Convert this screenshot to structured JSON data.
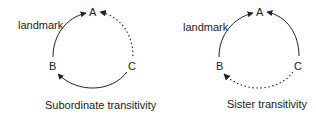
{
  "diagrams": [
    {
      "title": "Subordinate transitivity",
      "nodes": {
        "A": "A",
        "B": "B",
        "C": "C"
      },
      "landmark_label": "landmark",
      "edges": [
        {
          "from": "B",
          "to": "A",
          "style": "solid"
        },
        {
          "from": "C",
          "to": "B",
          "style": "solid"
        },
        {
          "from": "C",
          "to": "A",
          "style": "dotted"
        }
      ]
    },
    {
      "title": "Sister transitivity",
      "nodes": {
        "A": "A",
        "B": "B",
        "C": "C"
      },
      "landmark_label": "landmark",
      "edges": [
        {
          "from": "B",
          "to": "A",
          "style": "solid"
        },
        {
          "from": "C",
          "to": "A",
          "style": "solid"
        },
        {
          "from": "C",
          "to": "B",
          "style": "dotted"
        }
      ]
    }
  ],
  "colors": {
    "stroke": "#222222",
    "background": "#ffffff"
  }
}
